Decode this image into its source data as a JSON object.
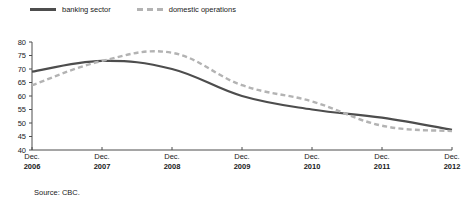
{
  "source_note": "Source: CBC.",
  "legend": {
    "position": "top-left",
    "entries": [
      {
        "label": "banking sector",
        "style": "solid",
        "color": "#4d4d4d",
        "icon": "solid-line-icon"
      },
      {
        "label": "domestic operations",
        "style": "dashed",
        "color": "#b3b3b3",
        "icon": "dashed-line-icon"
      }
    ]
  },
  "chart_data": {
    "type": "line",
    "title": "",
    "subtitle": "",
    "xlabel": "",
    "ylabel": "",
    "categories": [
      "Dec. 2006",
      "Dec. 2007",
      "Dec. 2008",
      "Dec. 2009",
      "Dec. 2010",
      "Dec. 2011",
      "Dec. 2012"
    ],
    "x_tick_months": [
      "Dec.",
      "Dec.",
      "Dec.",
      "Dec.",
      "Dec.",
      "Dec.",
      "Dec."
    ],
    "x_tick_years": [
      "2006",
      "2007",
      "2008",
      "2009",
      "2010",
      "2011",
      "2012"
    ],
    "ylim": [
      40,
      80
    ],
    "y_ticks": [
      40,
      45,
      50,
      55,
      60,
      65,
      70,
      75,
      80
    ],
    "y_tick_labels": [
      "40",
      "45",
      "50",
      "55",
      "60",
      "65",
      "70",
      "75",
      "80"
    ],
    "grid": false,
    "legend_position": "top-left",
    "series": [
      {
        "name": "banking sector",
        "style": "solid",
        "color": "#4d4d4d",
        "values": [
          69,
          73,
          70,
          60,
          55,
          52,
          47.5
        ]
      },
      {
        "name": "domestic operations",
        "style": "dashed",
        "color": "#b3b3b3",
        "values": [
          64,
          73,
          76,
          64,
          58,
          49,
          47
        ]
      }
    ]
  }
}
